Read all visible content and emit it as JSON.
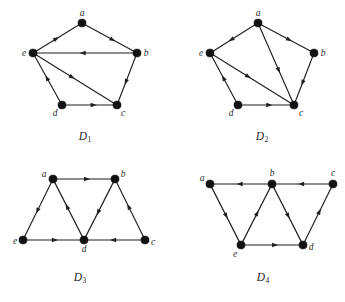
{
  "figure": {
    "background": "#ffffff",
    "ink_color": "#1f1f1f",
    "vertex_color": "#121212",
    "vertex_radius": 4.1,
    "arrow_size": 5.4,
    "width": 345,
    "height": 302,
    "top_cropped_text": ""
  },
  "graphs": [
    {
      "id": "D1",
      "caption_base": "D",
      "caption_sub": "1",
      "caption_x": 85,
      "caption_y": 137,
      "vertices": [
        {
          "name": "a",
          "x": 82,
          "y": 23,
          "label_dx": 0,
          "label_dy": -9
        },
        {
          "name": "b",
          "x": 137,
          "y": 53,
          "label_dx": 9,
          "label_dy": 1
        },
        {
          "name": "c",
          "x": 117,
          "y": 105,
          "label_dx": 6,
          "label_dy": 9
        },
        {
          "name": "d",
          "x": 62,
          "y": 105,
          "label_dx": -7,
          "label_dy": 9
        },
        {
          "name": "e",
          "x": 33,
          "y": 53,
          "label_dx": -9,
          "label_dy": 1
        }
      ],
      "edges": [
        {
          "from": "e",
          "to": "a",
          "arrow_t": 0.47
        },
        {
          "from": "a",
          "to": "b",
          "arrow_t": 0.56
        },
        {
          "from": "b",
          "to": "e",
          "arrow_t": 0.52
        },
        {
          "from": "b",
          "to": "c",
          "arrow_t": 0.56
        },
        {
          "from": "d",
          "to": "c",
          "arrow_t": 0.58
        },
        {
          "from": "d",
          "to": "e",
          "arrow_t": 0.52
        },
        {
          "from": "e",
          "to": "c",
          "arrow_t": 0.46
        }
      ]
    },
    {
      "id": "D2",
      "caption_base": "D",
      "caption_sub": "2",
      "caption_x": 262,
      "caption_y": 137,
      "vertices": [
        {
          "name": "a",
          "x": 258,
          "y": 23,
          "label_dx": 0,
          "label_dy": -9
        },
        {
          "name": "b",
          "x": 314,
          "y": 53,
          "label_dx": 9,
          "label_dy": 1
        },
        {
          "name": "c",
          "x": 294,
          "y": 105,
          "label_dx": 7,
          "label_dy": 9
        },
        {
          "name": "d",
          "x": 238,
          "y": 105,
          "label_dx": -7,
          "label_dy": 9
        },
        {
          "name": "e",
          "x": 210,
          "y": 53,
          "label_dx": -9,
          "label_dy": 1
        }
      ],
      "edges": [
        {
          "from": "a",
          "to": "e",
          "arrow_t": 0.56
        },
        {
          "from": "a",
          "to": "b",
          "arrow_t": 0.56
        },
        {
          "from": "a",
          "to": "c",
          "arrow_t": 0.58
        },
        {
          "from": "b",
          "to": "c",
          "arrow_t": 0.58
        },
        {
          "from": "d",
          "to": "c",
          "arrow_t": 0.56
        },
        {
          "from": "d",
          "to": "e",
          "arrow_t": 0.52
        },
        {
          "from": "e",
          "to": "c",
          "arrow_t": 0.45
        }
      ]
    },
    {
      "id": "D3",
      "caption_base": "D",
      "caption_sub": "3",
      "caption_x": 80,
      "caption_y": 278,
      "vertices": [
        {
          "name": "a",
          "x": 53,
          "y": 179,
          "label_dx": -9,
          "label_dy": -4
        },
        {
          "name": "b",
          "x": 115,
          "y": 179,
          "label_dx": 8,
          "label_dy": -4
        },
        {
          "name": "c",
          "x": 145,
          "y": 240,
          "label_dx": 8,
          "label_dy": 3
        },
        {
          "name": "d",
          "x": 84,
          "y": 240,
          "label_dx": 0,
          "label_dy": 10
        },
        {
          "name": "e",
          "x": 23,
          "y": 240,
          "label_dx": -8,
          "label_dy": 2
        }
      ],
      "edges": [
        {
          "from": "a",
          "to": "b",
          "arrow_t": 0.55
        },
        {
          "from": "a",
          "to": "e",
          "arrow_t": 0.52
        },
        {
          "from": "d",
          "to": "a",
          "arrow_t": 0.55
        },
        {
          "from": "b",
          "to": "d",
          "arrow_t": 0.55
        },
        {
          "from": "c",
          "to": "b",
          "arrow_t": 0.55
        },
        {
          "from": "e",
          "to": "d",
          "arrow_t": 0.52
        },
        {
          "from": "c",
          "to": "d",
          "arrow_t": 0.52
        }
      ]
    },
    {
      "id": "D4",
      "caption_base": "D",
      "caption_sub": "4",
      "caption_x": 263,
      "caption_y": 278,
      "vertices": [
        {
          "name": "a",
          "x": 210,
          "y": 184,
          "label_dx": -8,
          "label_dy": -5
        },
        {
          "name": "b",
          "x": 272,
          "y": 184,
          "label_dx": 0,
          "label_dy": -10
        },
        {
          "name": "c",
          "x": 333,
          "y": 184,
          "label_dx": 0,
          "label_dy": -10
        },
        {
          "name": "d",
          "x": 303,
          "y": 245,
          "label_dx": 8,
          "label_dy": 3
        },
        {
          "name": "e",
          "x": 241,
          "y": 245,
          "label_dx": -6,
          "label_dy": 10
        }
      ],
      "edges": [
        {
          "from": "b",
          "to": "a",
          "arrow_t": 0.52
        },
        {
          "from": "c",
          "to": "b",
          "arrow_t": 0.52
        },
        {
          "from": "a",
          "to": "e",
          "arrow_t": 0.52
        },
        {
          "from": "e",
          "to": "b",
          "arrow_t": 0.52
        },
        {
          "from": "b",
          "to": "d",
          "arrow_t": 0.52
        },
        {
          "from": "e",
          "to": "d",
          "arrow_t": 0.55
        },
        {
          "from": "d",
          "to": "c",
          "arrow_t": 0.55
        }
      ]
    }
  ]
}
